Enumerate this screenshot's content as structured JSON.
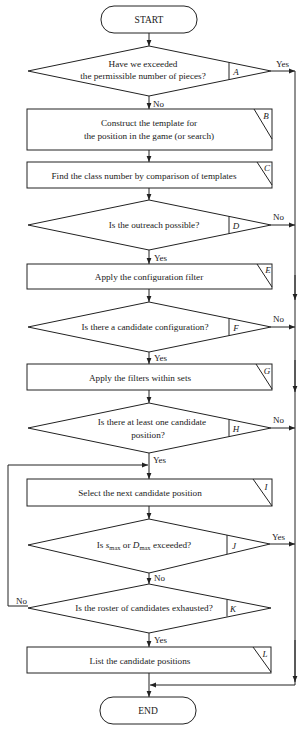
{
  "flowchart": {
    "start": {
      "text": "START"
    },
    "end": {
      "text": "END"
    },
    "nodes": [
      {
        "id": "A",
        "type": "decision",
        "lines": [
          "Have we exceeded",
          "the permissible number of pieces?"
        ],
        "label": "A"
      },
      {
        "id": "B",
        "type": "process",
        "lines": [
          "Construct the template for",
          "the position in the game (or search)"
        ],
        "label": "B"
      },
      {
        "id": "C",
        "type": "process",
        "lines": [
          "Find the class number by comparison of templates"
        ],
        "label": "C"
      },
      {
        "id": "D",
        "type": "decision",
        "lines": [
          "Is the outreach possible?"
        ],
        "label": "D"
      },
      {
        "id": "E",
        "type": "process",
        "lines": [
          "Apply the configuration filter"
        ],
        "label": "E"
      },
      {
        "id": "F",
        "type": "decision",
        "lines": [
          "Is there a candidate configuration?"
        ],
        "label": "F"
      },
      {
        "id": "G",
        "type": "process",
        "lines": [
          "Apply the filters within sets"
        ],
        "label": "G"
      },
      {
        "id": "H",
        "type": "decision",
        "lines": [
          "Is there at least one candidate",
          "position?"
        ],
        "label": "H"
      },
      {
        "id": "I",
        "type": "process",
        "lines": [
          "Select the next candidate position"
        ],
        "label": "I"
      },
      {
        "id": "J",
        "type": "decision",
        "parts": {
          "pre": "Is ",
          "s": "s",
          "sub1": "max",
          "mid": " or ",
          "d": "D",
          "sub2": "max",
          "post": " exceeded?"
        },
        "label": "J"
      },
      {
        "id": "K",
        "type": "decision",
        "lines": [
          "Is the roster of candidates exhausted?"
        ],
        "label": "K"
      },
      {
        "id": "L",
        "type": "process",
        "lines": [
          "List the candidate positions"
        ],
        "label": "L"
      }
    ],
    "edge_labels": {
      "A_yes": "Yes",
      "A_no": "No",
      "D_yes": "Yes",
      "D_no": "No",
      "F_yes": "Yes",
      "F_no": "No",
      "H_yes": "Yes",
      "H_no": "No",
      "J_yes": "Yes",
      "J_no": "No",
      "K_yes": "Yes",
      "K_no": "No"
    }
  }
}
